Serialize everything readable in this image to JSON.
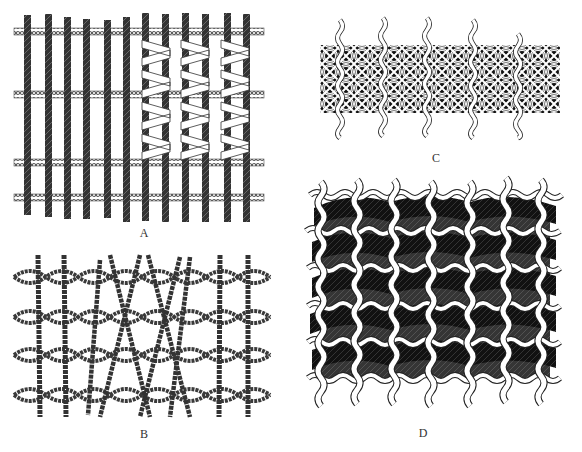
{
  "figure": {
    "panels": [
      {
        "id": "A",
        "label": "A",
        "type": "parallel warps with twined wefts, wrapped section",
        "warps": 12,
        "weft_rows": 4,
        "wrapped_warp_pairs": 3
      },
      {
        "id": "B",
        "label": "B",
        "type": "crossed-warp openwork with twined wefts",
        "weft_rows": 4
      },
      {
        "id": "C",
        "label": "C",
        "type": "interlinked openwork mesh with dark interstices",
        "warps": 5
      },
      {
        "id": "D",
        "label": "D",
        "type": "twined warps with dark supplementary weft",
        "warps": 7,
        "rows": 6
      }
    ],
    "caption_visible": "",
    "colors": {
      "background": "#ffffff",
      "dark_thread": "#2a2a2a",
      "light_thread_fill": "#ffffff",
      "outline": "#222222",
      "label_text": "#333333"
    }
  }
}
